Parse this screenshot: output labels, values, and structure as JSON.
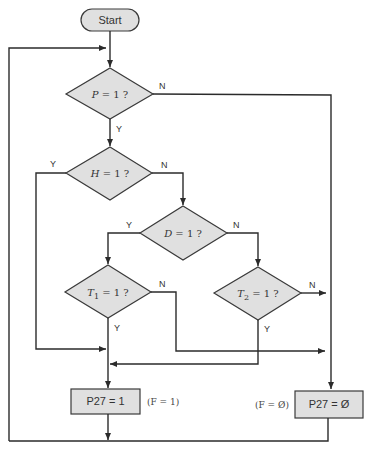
{
  "diagram": {
    "start": {
      "label": "Start"
    },
    "decisions": {
      "p": {
        "var": "P",
        "rest": " = 1 ?"
      },
      "h": {
        "var": "H",
        "rest": " = 1 ?"
      },
      "d": {
        "var": "D",
        "rest": " = 1 ?"
      },
      "t1": {
        "var": "T",
        "sub": "1",
        "rest": " = 1 ?"
      },
      "t2": {
        "var": "T",
        "sub": "2",
        "rest": " = 1 ?"
      }
    },
    "branch_labels": {
      "yes": "Y",
      "no": "N"
    },
    "outputs": {
      "p27_one": {
        "label": "P27 = 1",
        "note": "(F = 1)"
      },
      "p27_zero": {
        "label": "P27 = Ø",
        "note": "(F = Ø)"
      }
    },
    "colors": {
      "shape_fill": "#e0e0e0",
      "stroke": "#2b2b2b",
      "background": "#ffffff"
    }
  }
}
